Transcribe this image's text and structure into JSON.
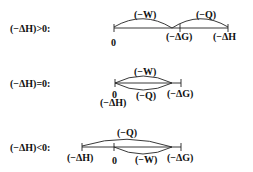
{
  "rows": [
    {
      "condition": "(−ΔH)>0:",
      "labels": {
        "zero": "0",
        "dG": "(−ΔG)",
        "dH": "(−ΔH",
        "W": "(−W)",
        "Q": "(−Q)"
      }
    },
    {
      "condition": "(−ΔH)=0:",
      "labels": {
        "zero": "0",
        "dH": "(−ΔH)",
        "W": "(−W)",
        "Q": "(−Q)",
        "dG": "(−ΔG)"
      }
    },
    {
      "condition": "(−ΔH)<0:",
      "labels": {
        "dH": "(−ΔH)",
        "zero": "0",
        "Q": "(−Q)",
        "W": "(−W)",
        "dG": "(−ΔG)"
      }
    }
  ],
  "colors": {
    "line": "#222222",
    "text": "#111111"
  }
}
